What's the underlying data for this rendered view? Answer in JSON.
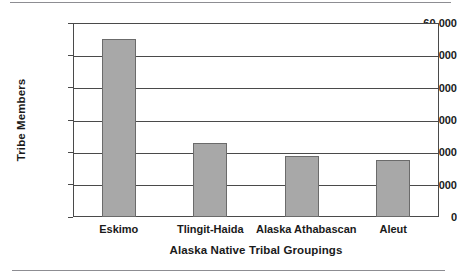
{
  "chart_data": {
    "type": "bar",
    "title": "",
    "xlabel": "Alaska Native Tribal Groupings",
    "ylabel": "Tribe Members",
    "categories": [
      "Eskimo",
      "Tlingit-Haida",
      "Alaska Athabascan",
      "Aleut"
    ],
    "values": [
      55000,
      22800,
      19000,
      17500
    ],
    "series": [
      {
        "name": "Tribe Members",
        "values": [
          55000,
          22800,
          19000,
          17500
        ]
      }
    ],
    "ylim": [
      0,
      60000
    ],
    "ytick_values": [
      0,
      10000,
      20000,
      30000,
      40000,
      50000,
      60000
    ],
    "ytick_labels": [
      "0",
      "10,000",
      "20,000",
      "30,000",
      "40,000",
      "50,000",
      "60,000"
    ],
    "grid": "horizontal",
    "legend": "none",
    "bar_color": "#a8a8a8",
    "bar_edge_color": "#6b6b6b",
    "axis_color": "#4a4a4a",
    "background_color": "#ffffff"
  },
  "page": {
    "rule_color": "#8d8d92"
  }
}
